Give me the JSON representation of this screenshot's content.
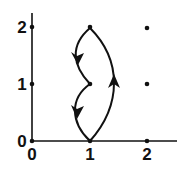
{
  "diagram": {
    "type": "lattice-path-graph",
    "axes": {
      "x_ticks": [
        "0",
        "1",
        "2"
      ],
      "y_ticks": [
        "0",
        "1",
        "2"
      ]
    },
    "grid_points": [
      {
        "x": 0,
        "y": 0
      },
      {
        "x": 1,
        "y": 0
      },
      {
        "x": 2,
        "y": 0
      },
      {
        "x": 0,
        "y": 1
      },
      {
        "x": 1,
        "y": 1
      },
      {
        "x": 2,
        "y": 1
      },
      {
        "x": 0,
        "y": 2
      },
      {
        "x": 1,
        "y": 2
      },
      {
        "x": 2,
        "y": 2
      }
    ],
    "edges": [
      {
        "from": [
          1,
          0
        ],
        "to": [
          1,
          2
        ],
        "side": "right",
        "direction": "up"
      },
      {
        "from": [
          1,
          2
        ],
        "to": [
          1,
          1
        ],
        "side": "left",
        "direction": "down"
      },
      {
        "from": [
          1,
          1
        ],
        "to": [
          1,
          0
        ],
        "side": "left",
        "direction": "down"
      }
    ],
    "colors": {
      "ink": "#111111",
      "background": "#ffffff"
    }
  }
}
